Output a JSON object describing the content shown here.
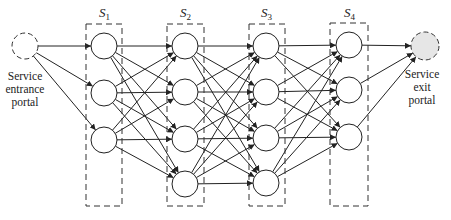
{
  "diagram": {
    "entry": {
      "label_lines": [
        "Service",
        "entrance",
        "portal"
      ],
      "x": 25,
      "y": 46,
      "r": 13,
      "fill": "#ffffff"
    },
    "exit": {
      "label_lines": [
        "Service",
        "exit",
        "portal"
      ],
      "x": 425,
      "y": 46,
      "r": 14,
      "fill": "#e6e6e6"
    },
    "stages": [
      {
        "name": "S",
        "sub": "1",
        "x": 104,
        "box": [
          86,
          24,
          122,
          206
        ],
        "nodes_y": [
          46,
          93,
          140
        ]
      },
      {
        "name": "S",
        "sub": "2",
        "x": 185,
        "box": [
          167,
          24,
          204,
          206
        ],
        "nodes_y": [
          46,
          92,
          139,
          184
        ]
      },
      {
        "name": "S",
        "sub": "3",
        "x": 266,
        "box": [
          249,
          24,
          285,
          206
        ],
        "nodes_y": [
          46,
          92,
          138,
          183
        ]
      },
      {
        "name": "S",
        "sub": "4",
        "x": 349,
        "box": [
          330,
          23,
          368,
          206
        ],
        "nodes_y": [
          45,
          90,
          137
        ]
      }
    ],
    "node_radius": 13,
    "edge_color": "#222222",
    "connectivity": "fully connected between adjacent stages; entry to all S1 nodes; all S4 nodes to exit"
  }
}
